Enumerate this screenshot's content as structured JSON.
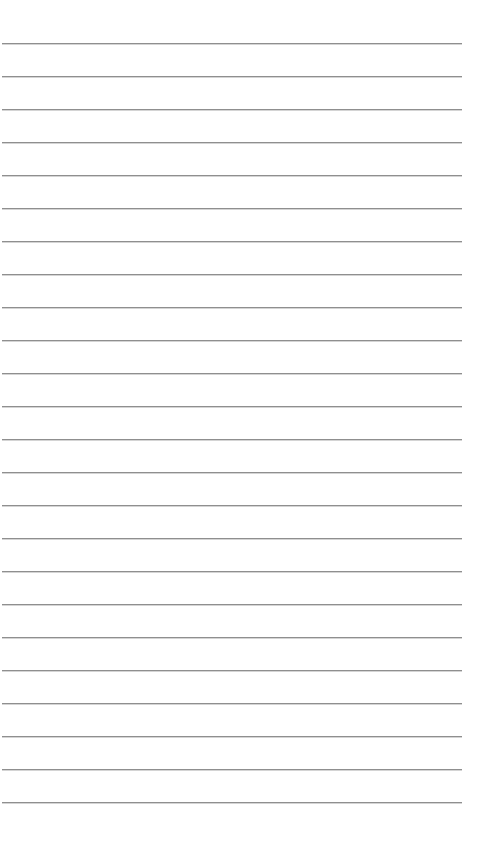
{
  "page": {
    "type": "lined-paper",
    "background": "#ffffff",
    "line_color": "#8f8f8f",
    "line_count": 24,
    "first_line_y": 43,
    "line_spacing": 33,
    "line_left": 2,
    "line_width": 460
  }
}
